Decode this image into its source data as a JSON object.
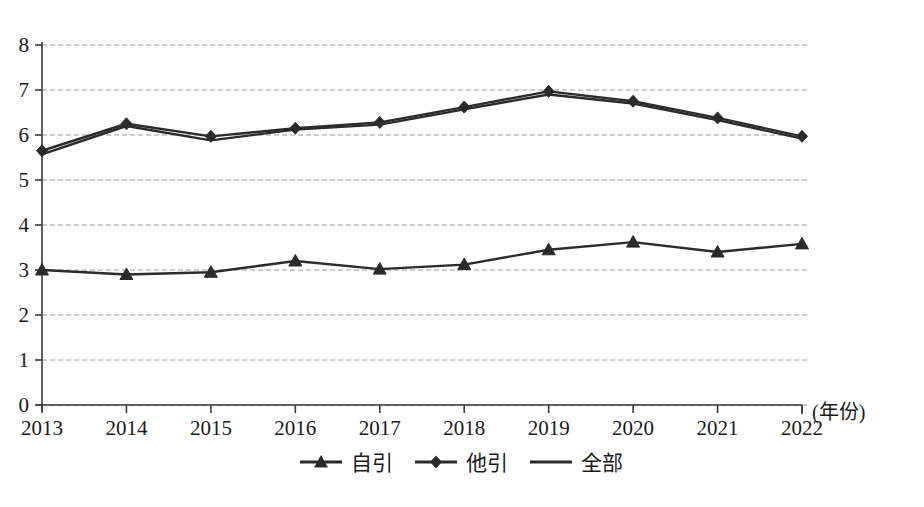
{
  "chart_data": {
    "type": "line",
    "title": "",
    "xlabel": "年份",
    "ylabel": "",
    "x": [
      2013,
      2014,
      2015,
      2016,
      2017,
      2018,
      2019,
      2020,
      2021,
      2022
    ],
    "categories": [
      "2013",
      "2014",
      "2015",
      "2016",
      "2017",
      "2018",
      "2019",
      "2020",
      "2021",
      "2022"
    ],
    "series": [
      {
        "name": "自引",
        "marker": "triangle",
        "values": [
          3.0,
          2.9,
          2.95,
          3.2,
          3.02,
          3.12,
          3.45,
          3.62,
          3.4,
          3.58
        ]
      },
      {
        "name": "他引",
        "marker": "diamond",
        "values": [
          5.65,
          6.25,
          5.97,
          6.15,
          6.28,
          6.62,
          6.97,
          6.75,
          6.38,
          5.97
        ]
      },
      {
        "name": "全部",
        "marker": "none",
        "values": [
          5.57,
          6.2,
          5.88,
          6.12,
          6.23,
          6.57,
          6.9,
          6.7,
          6.33,
          5.92
        ]
      }
    ],
    "ylim": [
      0,
      8
    ],
    "yticks": [
      0,
      1,
      2,
      3,
      4,
      5,
      6,
      7,
      8
    ],
    "ytick_labels": [
      "0",
      "1",
      "2",
      "3",
      "4",
      "5",
      "6",
      "7",
      "8"
    ],
    "grid": true,
    "grid_style": "dashed-horizontal",
    "legend_position": "bottom",
    "line_color": "#2b2b2b",
    "grid_color": "#9a9a9a",
    "axis_color": "#3a3a3a",
    "background": "#ffffff"
  },
  "axis": {
    "x_unit_suffix": "(年份)"
  },
  "legend": {
    "items": [
      {
        "label": "自引",
        "marker": "triangle-marker"
      },
      {
        "label": "他引",
        "marker": "diamond-marker"
      },
      {
        "label": "全部",
        "marker": "plain-line-marker"
      }
    ]
  }
}
